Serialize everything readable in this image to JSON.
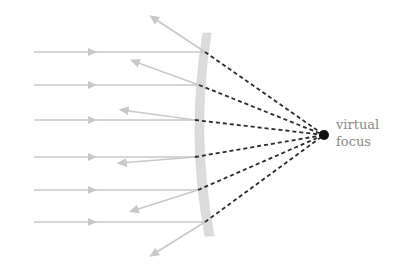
{
  "diagram": {
    "label_line1": "virtual",
    "label_line2": "focus",
    "colors": {
      "ray": "#c8c8c8",
      "mirror": "#dcdcdc",
      "mirror_edge": "#c4c4c4",
      "dashed": "#2a2a2a",
      "focus": "#111111",
      "label": "#8a8a8a"
    },
    "focus": {
      "x": 324,
      "y": 135
    },
    "incoming_rays": [
      {
        "y": 52,
        "hit_x": 205
      },
      {
        "y": 85,
        "hit_x": 199
      },
      {
        "y": 120,
        "hit_x": 195
      },
      {
        "y": 157,
        "hit_x": 195
      },
      {
        "y": 190,
        "hit_x": 198
      },
      {
        "y": 222,
        "hit_x": 205
      }
    ],
    "reflected_rays": [
      {
        "x2": 152,
        "y2": 17
      },
      {
        "x2": 133,
        "y2": 61
      },
      {
        "x2": 122,
        "y2": 110
      },
      {
        "x2": 120,
        "y2": 163
      },
      {
        "x2": 132,
        "y2": 211
      },
      {
        "x2": 152,
        "y2": 255
      }
    ]
  }
}
